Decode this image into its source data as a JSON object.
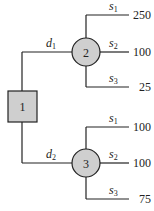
{
  "diagram": {
    "type": "decision-tree",
    "decision_node": {
      "label": "1"
    },
    "chance_nodes": [
      {
        "label": "2",
        "decision": {
          "name": "d",
          "sub": "1"
        },
        "branches": [
          {
            "state": "s",
            "sub": "1",
            "payoff": "250"
          },
          {
            "state": "s",
            "sub": "2",
            "payoff": "100"
          },
          {
            "state": "s",
            "sub": "3",
            "payoff": "25"
          }
        ]
      },
      {
        "label": "3",
        "decision": {
          "name": "d",
          "sub": "2"
        },
        "branches": [
          {
            "state": "s",
            "sub": "1",
            "payoff": "100"
          },
          {
            "state": "s",
            "sub": "2",
            "payoff": "100"
          },
          {
            "state": "s",
            "sub": "3",
            "payoff": "75"
          }
        ]
      }
    ],
    "colors": {
      "node_fill": "#cfcfcf",
      "line": "#222222"
    }
  }
}
